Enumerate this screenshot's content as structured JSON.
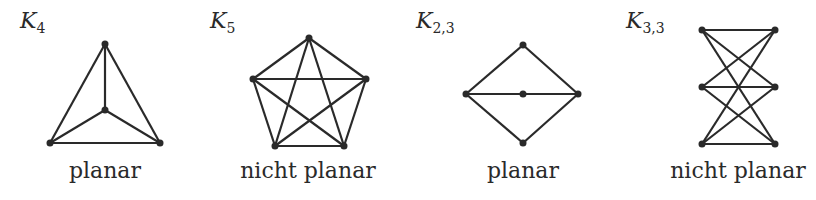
{
  "graphs": [
    {
      "name": "K",
      "subscript": "4",
      "caption": "planar",
      "nodes": [
        [
          105,
          44
        ],
        [
          105,
          110
        ],
        [
          50,
          143
        ],
        [
          160,
          143
        ]
      ],
      "edges": [
        [
          0,
          1
        ],
        [
          0,
          2
        ],
        [
          0,
          3
        ],
        [
          1,
          2
        ],
        [
          1,
          3
        ],
        [
          2,
          3
        ]
      ],
      "title_pos": [
        20,
        6
      ],
      "caption_center": 105
    },
    {
      "name": "K",
      "subscript": "5",
      "caption": "nicht planar",
      "nodes": [
        [
          309,
          38
        ],
        [
          253,
          79
        ],
        [
          366,
          79
        ],
        [
          275,
          146
        ],
        [
          344,
          146
        ]
      ],
      "edges": [
        [
          0,
          1
        ],
        [
          0,
          2
        ],
        [
          0,
          3
        ],
        [
          0,
          4
        ],
        [
          1,
          2
        ],
        [
          1,
          3
        ],
        [
          1,
          4
        ],
        [
          2,
          3
        ],
        [
          2,
          4
        ],
        [
          3,
          4
        ]
      ],
      "title_pos": [
        210,
        6
      ],
      "caption_center": 308
    },
    {
      "name": "K",
      "subscript": "2,3",
      "caption": "planar",
      "nodes": [
        [
          466,
          94
        ],
        [
          578,
          94
        ],
        [
          523,
          45
        ],
        [
          523,
          94
        ],
        [
          523,
          143
        ]
      ],
      "edges": [
        [
          0,
          2
        ],
        [
          0,
          3
        ],
        [
          0,
          4
        ],
        [
          1,
          2
        ],
        [
          1,
          3
        ],
        [
          1,
          4
        ]
      ],
      "title_pos": [
        416,
        6
      ],
      "caption_center": 523
    },
    {
      "name": "K",
      "subscript": "3,3",
      "caption": "nicht planar",
      "nodes": [
        [
          702,
          30
        ],
        [
          702,
          87
        ],
        [
          702,
          144
        ],
        [
          775,
          30
        ],
        [
          775,
          87
        ],
        [
          775,
          144
        ]
      ],
      "edges": [
        [
          0,
          3
        ],
        [
          0,
          4
        ],
        [
          0,
          5
        ],
        [
          1,
          3
        ],
        [
          1,
          4
        ],
        [
          1,
          5
        ],
        [
          2,
          3
        ],
        [
          2,
          4
        ],
        [
          2,
          5
        ]
      ],
      "title_pos": [
        626,
        6
      ],
      "caption_center": 738
    }
  ],
  "style": {
    "stroke": "#2a2a2a",
    "node_radius": 3.5
  }
}
